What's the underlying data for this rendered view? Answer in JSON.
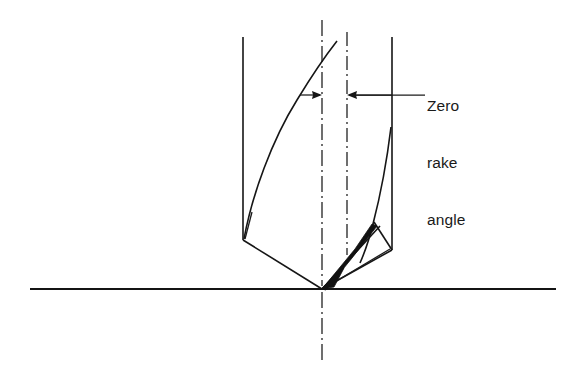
{
  "figure": {
    "background_color": "#ffffff",
    "line_color": "#161616",
    "fill_color": "#111111",
    "width": 584,
    "height": 381
  },
  "annotation": {
    "label_lines": [
      "Zero",
      "rake",
      "angle"
    ],
    "full_text": "Zero rake angle",
    "line_1": "Zero",
    "line_2": "rake",
    "line_3": "angle"
  },
  "geometry": {
    "baseline": {
      "x1": 30,
      "y1": 289,
      "x2": 556,
      "y2": 289
    },
    "axis_centerline": {
      "x": 322,
      "y_top": 20,
      "y_bottom": 360
    },
    "reference_centerline": {
      "x": 347,
      "y_top": 32,
      "y_bottom": 255
    },
    "body_left_edge": {
      "x": 243,
      "y_top": 37,
      "y_bottom": 240
    },
    "body_right_edge": {
      "x": 392,
      "y_top": 37,
      "y_bottom": 250
    },
    "drill_point": {
      "x": 322,
      "y": 289
    },
    "left_shoulder": {
      "x": 243,
      "y": 240
    },
    "right_shoulder": {
      "x": 392,
      "y": 250
    },
    "flute_curve_top": {
      "x": 337,
      "y": 41
    },
    "leader_line": {
      "x1": 355,
      "y1": 95,
      "x2": 425,
      "y2": 95
    },
    "dimension_arrows": [
      {
        "name": "left-arrow",
        "tip_x": 322,
        "tail_x": 300,
        "y": 95,
        "direction": "right"
      },
      {
        "name": "right-arrow",
        "tip_x": 347,
        "tail_x": 392,
        "y": 95,
        "direction": "left"
      }
    ]
  }
}
